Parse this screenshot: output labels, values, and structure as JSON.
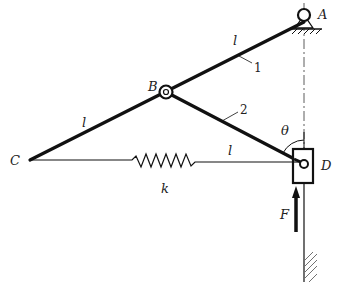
{
  "diagram": {
    "type": "mechanism",
    "points": {
      "A": {
        "label": "A",
        "desc": "fixed pivot support"
      },
      "B": {
        "label": "B",
        "desc": "hinge joint between bars"
      },
      "C": {
        "label": "C",
        "desc": "free end of bar 1"
      },
      "D": {
        "label": "D",
        "desc": "slider in vertical guide"
      }
    },
    "bars": [
      {
        "id": "1",
        "label": "1",
        "length_label": "l",
        "from": "A",
        "to": "C",
        "note": "continuous bar A-B-C"
      },
      {
        "id": "2",
        "label": "2",
        "length_label": "l",
        "from": "B",
        "to": "D"
      }
    ],
    "segment_labels": {
      "AB": "l",
      "BC": "l",
      "BD": "l"
    },
    "spring": {
      "label": "k",
      "from": "C",
      "to": "D"
    },
    "force": {
      "label": "F",
      "direction": "up",
      "applied_at": "D"
    },
    "angle": {
      "label": "θ",
      "at": "D",
      "between": "DB and vertical"
    },
    "colors": {
      "line": "#111111",
      "background": "#ffffff"
    }
  }
}
